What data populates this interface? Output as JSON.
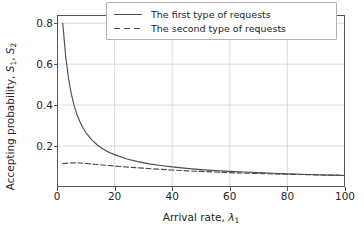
{
  "chart_data": {
    "type": "line",
    "title": "",
    "xlabel": "Arrival rate, λ₁",
    "xlabel_text": "Arrival rate, ",
    "xlabel_sym": "λ",
    "xlabel_sub": "1",
    "ylabel": "Accepting probability, S₁, S₂",
    "ylabel_text": "Accepting probability, ",
    "ylabel_sym1": "S",
    "ylabel_sub1": "1",
    "ylabel_sep": ", ",
    "ylabel_sym2": "S",
    "ylabel_sub2": "2",
    "xlim": [
      0,
      100
    ],
    "ylim": [
      0.0,
      0.84
    ],
    "xticks": [
      "0",
      "20",
      "40",
      "60",
      "80",
      "100"
    ],
    "xtick_values": [
      0,
      20,
      40,
      60,
      80,
      100
    ],
    "yticks": [
      "0.2",
      "0.4",
      "0.6",
      "0.8"
    ],
    "ytick_values": [
      0.2,
      0.4,
      0.6,
      0.8
    ],
    "grid": true,
    "grid_color": "#d9d9d9",
    "axes_color": "#555555",
    "legend_position": "upper right",
    "legend": [
      {
        "label": "The first type of requests",
        "style": "solid",
        "color": "#4d4d4d"
      },
      {
        "label": "The second type of requests",
        "style": "dashed",
        "color": "#4d4d4d"
      }
    ],
    "series": [
      {
        "name": "The first type of requests",
        "label": "The first type of requests",
        "style": "solid",
        "color": "#4d4d4d",
        "x": [
          2,
          3,
          4,
          5,
          6,
          7,
          8,
          9,
          10,
          12,
          14,
          16,
          18,
          20,
          24,
          28,
          32,
          36,
          40,
          45,
          50,
          55,
          60,
          65,
          70,
          75,
          80,
          85,
          90,
          95,
          100
        ],
        "y": [
          0.8,
          0.64,
          0.53,
          0.452,
          0.395,
          0.351,
          0.317,
          0.289,
          0.266,
          0.231,
          0.205,
          0.186,
          0.17,
          0.158,
          0.138,
          0.124,
          0.113,
          0.105,
          0.098,
          0.091,
          0.085,
          0.08,
          0.076,
          0.073,
          0.07,
          0.067,
          0.064,
          0.062,
          0.06,
          0.058,
          0.056
        ]
      },
      {
        "name": "The second type of requests",
        "label": "The second type of requests",
        "style": "dashed",
        "color": "#4d4d4d",
        "x": [
          2,
          4,
          6,
          8,
          10,
          14,
          18,
          22,
          26,
          30,
          35,
          40,
          45,
          50,
          55,
          60,
          65,
          70,
          75,
          80,
          85,
          90,
          95,
          100
        ],
        "y": [
          0.114,
          0.117,
          0.118,
          0.117,
          0.115,
          0.11,
          0.105,
          0.1,
          0.096,
          0.092,
          0.087,
          0.083,
          0.079,
          0.076,
          0.073,
          0.07,
          0.068,
          0.066,
          0.064,
          0.062,
          0.061,
          0.059,
          0.058,
          0.057
        ]
      }
    ]
  }
}
